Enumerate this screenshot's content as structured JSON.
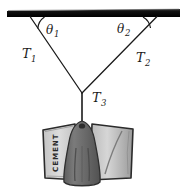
{
  "figure": {
    "type": "physics-free-body-diagram",
    "background_color": "#ffffff",
    "ink_color": "#1a1a1a"
  },
  "support": {
    "name": "ceiling-bar",
    "color": "#111111",
    "x1": 7,
    "y1": 13,
    "x2": 180,
    "y2": 13,
    "thickness": 6
  },
  "geometry": {
    "junction": {
      "x": 82,
      "y": 93
    },
    "left_anchor": {
      "x": 30,
      "y": 16
    },
    "right_anchor": {
      "x": 157,
      "y": 16
    },
    "hook_bottom": {
      "x": 82,
      "y": 122
    }
  },
  "labels": {
    "theta1": {
      "base": "θ",
      "sub": "1",
      "x": 47,
      "y": 32
    },
    "theta2": {
      "base": "θ",
      "sub": "2",
      "x": 118,
      "y": 30
    },
    "T1": {
      "base": "T",
      "sub": "1",
      "x": 25,
      "y": 57
    },
    "T2": {
      "base": "T",
      "sub": "2",
      "x": 138,
      "y": 60
    },
    "T3": {
      "base": "T",
      "sub": "3",
      "x": 93,
      "y": 100
    }
  },
  "load": {
    "name": "cement-bag",
    "text": "CEMENT",
    "bag_color": "#d2d2d2",
    "bag_shade": "#a8a8a8",
    "bag_outline": "#2b2b2b",
    "holder_color": "#6e6e6e",
    "holder_shade": "#4a4a4a"
  },
  "arcs": {
    "theta1_arc_color": "#1a1a1a",
    "theta2_arc_color": "#1a1a1a"
  }
}
